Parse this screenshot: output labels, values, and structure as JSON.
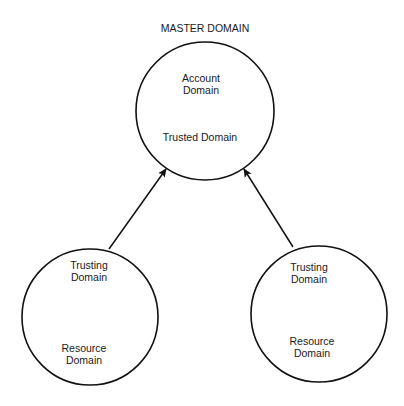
{
  "diagram": {
    "title": "MASTER DOMAIN",
    "nodes": [
      {
        "id": "master",
        "lines": [
          "Account",
          "Domain"
        ],
        "sub": "Trusted Domain",
        "cx": 205,
        "cy": 111,
        "r": 69
      },
      {
        "id": "left",
        "lines": [
          "Trusting",
          "Domain"
        ],
        "sub_lines": [
          "Resource",
          "Domain"
        ],
        "cx": 90,
        "cy": 317,
        "r": 68
      },
      {
        "id": "right",
        "lines": [
          "Trusting",
          "Domain"
        ],
        "sub_lines": [
          "Resource",
          "Domain"
        ],
        "cx": 319,
        "cy": 314,
        "r": 68
      }
    ],
    "edges": [
      {
        "from": "left",
        "to": "master",
        "label": "trusts"
      },
      {
        "from": "right",
        "to": "master",
        "label": "trusts"
      }
    ]
  }
}
